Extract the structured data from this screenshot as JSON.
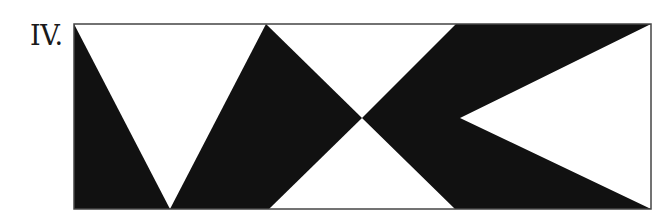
{
  "figure": {
    "label": "IV.",
    "frame": {
      "x": 74,
      "y": 24,
      "width": 577,
      "height": 185,
      "stroke": "#444444"
    },
    "fill_color": "#111111",
    "background": "#ffffff",
    "shapes": [
      {
        "name": "left-black-triangle",
        "points": "74,24 170,209 74,209"
      },
      {
        "name": "center-left-black-shape",
        "points": "170,209 266,24 362,118 269,209"
      },
      {
        "name": "right-black-shape",
        "points": "362,118 456,24 651,24 460,118 651,209 455,209"
      }
    ]
  }
}
